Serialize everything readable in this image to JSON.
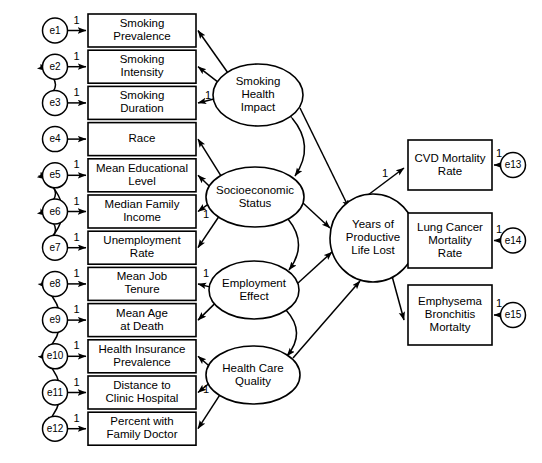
{
  "diagram": {
    "type": "structural-equation-model-path-diagram",
    "title": "",
    "fixed_loading_label": "1",
    "colors": {
      "stroke": "#000000",
      "fill": "#ffffff",
      "background": "#ffffff"
    }
  },
  "indicators": [
    {
      "id": "smoking-prevalence",
      "lines": [
        "Smoking",
        "Prevalence"
      ],
      "error": "e1",
      "fixed": "1",
      "latent": "smoking-health-impact"
    },
    {
      "id": "smoking-intensity",
      "lines": [
        "Smoking",
        "Intensity"
      ],
      "error": "e2",
      "fixed": "1",
      "latent": "smoking-health-impact"
    },
    {
      "id": "smoking-duration",
      "lines": [
        "Smoking",
        "Duration"
      ],
      "error": "e3",
      "fixed": "1",
      "latent": "smoking-health-impact"
    },
    {
      "id": "race",
      "lines": [
        "Race"
      ],
      "error": "e4",
      "fixed": "",
      "latent": "socioeconomic-status"
    },
    {
      "id": "mean-educational-level",
      "lines": [
        "Mean Educational",
        "Level"
      ],
      "error": "e5",
      "fixed": "1",
      "latent": "socioeconomic-status"
    },
    {
      "id": "median-family-income",
      "lines": [
        "Median Family",
        "Income"
      ],
      "error": "e6",
      "fixed": "1",
      "latent": "socioeconomic-status"
    },
    {
      "id": "unemployment-rate",
      "lines": [
        "Unemployment",
        "Rate"
      ],
      "error": "e7",
      "fixed": "1",
      "latent": "socioeconomic-status"
    },
    {
      "id": "mean-job-tenure",
      "lines": [
        "Mean Job",
        "Tenure"
      ],
      "error": "e8",
      "fixed": "1",
      "latent": "employment-effect"
    },
    {
      "id": "mean-age-at-death",
      "lines": [
        "Mean Age",
        "at Death"
      ],
      "error": "e9",
      "fixed": "1",
      "latent": "employment-effect"
    },
    {
      "id": "health-insurance-prevalence",
      "lines": [
        "Health Insurance",
        "Prevalence"
      ],
      "error": "e10",
      "fixed": "1",
      "latent": "health-care-quality"
    },
    {
      "id": "distance-to-clinic-hospital",
      "lines": [
        "Distance to",
        "Clinic Hospital"
      ],
      "error": "e11",
      "fixed": "1",
      "latent": "health-care-quality"
    },
    {
      "id": "percent-with-family-doctor",
      "lines": [
        "Percent with",
        "Family Doctor"
      ],
      "error": "e12",
      "fixed": "1",
      "latent": "health-care-quality"
    }
  ],
  "latents": [
    {
      "id": "smoking-health-impact",
      "lines": [
        "Smoking",
        "Health",
        "Impact"
      ]
    },
    {
      "id": "socioeconomic-status",
      "lines": [
        "Socioeconomic",
        "Status"
      ]
    },
    {
      "id": "employment-effect",
      "lines": [
        "Employment",
        "Effect"
      ]
    },
    {
      "id": "health-care-quality",
      "lines": [
        "Health Care",
        "Quality"
      ]
    }
  ],
  "outcome_latent": {
    "id": "years-of-productive-life-lost",
    "lines": [
      "Years of",
      "Productive",
      "Life Lost"
    ]
  },
  "outcomes": [
    {
      "id": "cvd-mortality-rate",
      "lines": [
        "CVD Mortality",
        "Rate"
      ],
      "error": "e13",
      "fixed": "1",
      "path_fixed": "1"
    },
    {
      "id": "lung-cancer-mortality-rate",
      "lines": [
        "Lung Cancer",
        "Mortality",
        "Rate"
      ],
      "error": "e14",
      "fixed": "1",
      "path_fixed": ""
    },
    {
      "id": "emphysema-bronchitis-mortalty",
      "lines": [
        "Emphysema",
        "Bronchitis",
        "Mortalty"
      ],
      "error": "e15",
      "fixed": "1",
      "path_fixed": ""
    }
  ],
  "loading_fixed_markers": [
    {
      "latent": "smoking-health-impact",
      "indicator": "smoking-duration",
      "label": "1"
    },
    {
      "latent": "socioeconomic-status",
      "indicator": "median-family-income",
      "label": "1"
    },
    {
      "latent": "employment-effect",
      "indicator": "unemployment-rate",
      "label": "1"
    },
    {
      "latent": "health-care-quality",
      "indicator": "distance-to-clinic-hospital",
      "label": "1"
    }
  ],
  "error_covariances": [
    {
      "from": "e2",
      "to": "e3"
    },
    {
      "from": "e5",
      "to": "e6"
    },
    {
      "from": "e6",
      "to": "e7"
    },
    {
      "from": "e5",
      "to": "e7"
    },
    {
      "from": "e8",
      "to": "e10"
    },
    {
      "from": "e10",
      "to": "e12"
    }
  ],
  "latent_covariances": [
    {
      "from": "smoking-health-impact",
      "to": "socioeconomic-status"
    },
    {
      "from": "socioeconomic-status",
      "to": "employment-effect"
    },
    {
      "from": "employment-effect",
      "to": "health-care-quality"
    }
  ],
  "structural_paths": [
    {
      "from": "smoking-health-impact",
      "to": "years-of-productive-life-lost"
    },
    {
      "from": "socioeconomic-status",
      "to": "years-of-productive-life-lost"
    },
    {
      "from": "employment-effect",
      "to": "years-of-productive-life-lost"
    },
    {
      "from": "health-care-quality",
      "to": "years-of-productive-life-lost"
    }
  ]
}
